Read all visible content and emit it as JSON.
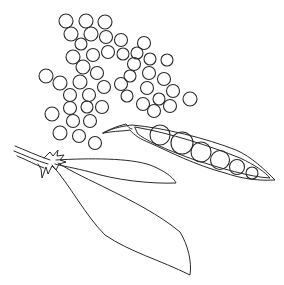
{
  "illustration": {
    "subject": "peas and pea pods line drawing",
    "background": "#ffffff",
    "stroke_color": "#2a2a2a",
    "loose_peas": [
      [
        66,
        21,
        7
      ],
      [
        86,
        21,
        7
      ],
      [
        105,
        22,
        7
      ],
      [
        71,
        34,
        7
      ],
      [
        91,
        34,
        7
      ],
      [
        106,
        37,
        6.5
      ],
      [
        121,
        40,
        6.5
      ],
      [
        81,
        44,
        6
      ],
      [
        144,
        43,
        6.5
      ],
      [
        73,
        57,
        7
      ],
      [
        93,
        55,
        6.5
      ],
      [
        108,
        52,
        6.5
      ],
      [
        123,
        54,
        6
      ],
      [
        137,
        53,
        6
      ],
      [
        150,
        59,
        6
      ],
      [
        167,
        60,
        6
      ],
      [
        83,
        67,
        7
      ],
      [
        97,
        73,
        6.5
      ],
      [
        134,
        64,
        6.5
      ],
      [
        130,
        76,
        6
      ],
      [
        149,
        73,
        6.5
      ],
      [
        164,
        79,
        6.5
      ],
      [
        46,
        76,
        7
      ],
      [
        60,
        83,
        7
      ],
      [
        80,
        82,
        7
      ],
      [
        104,
        87,
        6.5
      ],
      [
        121,
        84,
        6.5
      ],
      [
        147,
        88,
        6.5
      ],
      [
        173,
        91,
        6.5
      ],
      [
        70,
        95,
        6.5
      ],
      [
        89,
        95,
        6.5
      ],
      [
        127,
        96,
        6
      ],
      [
        143,
        104,
        6.5
      ],
      [
        159,
        99,
        6
      ],
      [
        170,
        106,
        6.5
      ],
      [
        190,
        99,
        7
      ],
      [
        70,
        108,
        6.5
      ],
      [
        87,
        107,
        6
      ],
      [
        102,
        107,
        6.5
      ],
      [
        154,
        111,
        6.5
      ],
      [
        52,
        114,
        7
      ],
      [
        73,
        121,
        6.5
      ],
      [
        90,
        121,
        6.5
      ],
      [
        60,
        133,
        7
      ],
      [
        79,
        136,
        6.5
      ],
      [
        95,
        143,
        6.5
      ]
    ],
    "open_pod": {
      "outer": "M103,133 C115,127 125,126 132,125 C165,128 205,138 236,150 C252,157 265,170 275,180 C255,181 240,178 225,173 C195,165 170,152 150,143 C140,139 134,135 130,130 C125,131 118,131 110,132 Z",
      "inner": "M135,127 C170,133 210,146 240,158 C255,165 265,172 270,178 C250,177 220,168 195,160 C170,151 148,142 138,134 Z",
      "stem": "M103,133 C110,129 118,126 126,124 C128,127 130,129 132,129",
      "peas_inside": [
        [
          160,
          135,
          10
        ],
        [
          182,
          143,
          11
        ],
        [
          201,
          152,
          10
        ],
        [
          220,
          160,
          9.5
        ],
        [
          237,
          167,
          7.5
        ],
        [
          252,
          173,
          6
        ]
      ]
    },
    "closed_pod_upper": {
      "outline": "M56,160 C90,158 130,158 150,165 C168,172 175,180 176,183 C150,184 115,180 90,172 C75,168 62,166 55,164"
    },
    "closed_pod_lower": {
      "outline": "M52,165 C70,185 85,215 105,235 C130,252 160,260 190,275 C192,262 188,245 180,232 C160,215 130,200 110,190 C90,180 72,172 58,163"
    },
    "stem": {
      "lines": [
        "M15,146 C25,150 38,156 50,160",
        "M14,151 C24,155 37,161 48,164",
        "M17,156 C27,160 36,165 44,168"
      ],
      "calyx": "M44,158 L50,152 L53,156 L58,150 L57,156 L64,155 L60,160 L66,162 L59,164 L56,170 L52,166 L48,174 L46,167 L42,178 L41,169 L38,164"
    }
  }
}
